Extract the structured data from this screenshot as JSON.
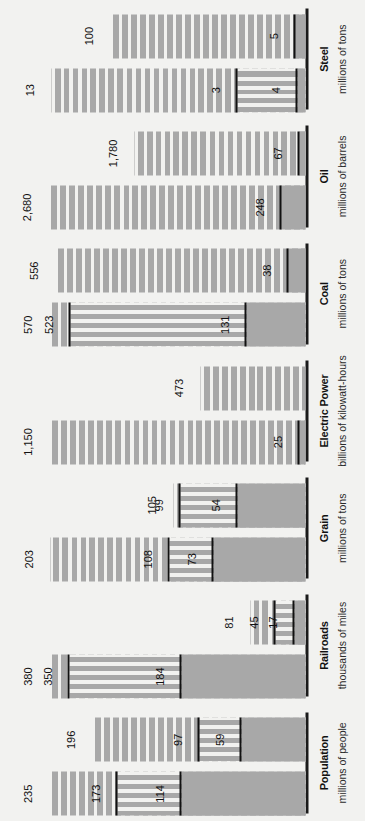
{
  "chart_data": {
    "type": "bar",
    "title": "",
    "xlabel": "",
    "ylabel": "",
    "orientation": "vertical-bars-rotated-90ccw",
    "grid": false,
    "legend_position": "none",
    "note": "Each category shows two bars (left and right). Every bar is divided into three stacked tiers whose cumulative values are labelled at each tier boundary.",
    "categories": [
      {
        "name": "Population",
        "unit": "millions of people",
        "axis_max": 260,
        "bars": [
          {
            "tier_labels": [
              "114",
              "173",
              "235"
            ],
            "tier_values": [
              114,
              173,
              235
            ]
          },
          {
            "tier_labels": [
              "59",
              "97",
              "196"
            ],
            "tier_values": [
              59,
              97,
              196
            ]
          }
        ]
      },
      {
        "name": "Railroads",
        "unit": "thousands of miles",
        "axis_max": 420,
        "bars": [
          {
            "tier_labels": [
              "184",
              "350",
              "380"
            ],
            "tier_values": [
              184,
              350,
              380
            ]
          },
          {
            "tier_labels": [
              "17",
              "45",
              "81"
            ],
            "tier_values": [
              17,
              45,
              81
            ]
          }
        ]
      },
      {
        "name": "Grain",
        "unit": "millions of tons",
        "axis_max": 225,
        "bars": [
          {
            "tier_labels": [
              "73",
              "108",
              "203"
            ],
            "tier_values": [
              73,
              108,
              203
            ]
          },
          {
            "tier_labels": [
              "54",
              "99",
              "105"
            ],
            "tier_values": [
              54,
              99,
              105
            ]
          }
        ]
      },
      {
        "name": "Electric Power",
        "unit": "billions of kilowatt-hours",
        "axis_max": 1270,
        "bars": [
          {
            "tier_labels": [
              "25",
              "1,150"
            ],
            "tier_values": [
              25,
              1150
            ]
          },
          {
            "tier_labels": [
              "473"
            ],
            "tier_values": [
              473
            ]
          }
        ]
      },
      {
        "name": "Coal",
        "unit": "millions of tons",
        "axis_max": 630,
        "bars": [
          {
            "tier_labels": [
              "131",
              "523",
              "570"
            ],
            "tier_values": [
              131,
              523,
              570
            ]
          },
          {
            "tier_labels": [
              "38",
              "556"
            ],
            "tier_values": [
              38,
              556
            ]
          }
        ]
      },
      {
        "name": "Oil",
        "unit": "millions of barrels",
        "axis_max": 2950,
        "bars": [
          {
            "tier_labels": [
              "248",
              "2,680"
            ],
            "tier_values": [
              248,
              2680
            ]
          },
          {
            "tier_labels": [
              "67",
              "1,780"
            ],
            "tier_values": [
              67,
              1780
            ]
          }
        ]
      },
      {
        "name": "Steel",
        "unit": "millions of tons",
        "axis_max": 145,
        "bars": [
          {
            "tier_labels": [
              "4",
              "3",
              "13"
            ],
            "tier_values": [
              4,
              35,
              130
            ]
          },
          {
            "tier_labels": [
              "5",
              "100"
            ],
            "tier_values": [
              5,
              100
            ]
          }
        ]
      }
    ]
  },
  "colors": {
    "background": "#f2f2f0",
    "bar_fill": "#a8a8a8",
    "axis": "#1a1a1a",
    "text": "#111111"
  }
}
